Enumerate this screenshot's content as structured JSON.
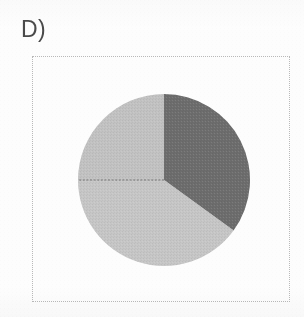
{
  "figure": {
    "panel_label": "D)",
    "frame": {
      "style": "dotted",
      "color": "#b9b9b9"
    }
  },
  "chart_data": {
    "type": "pie",
    "title": "D)",
    "subtitle": "",
    "xlabel": "",
    "ylabel": "",
    "grid": false,
    "legend": "none",
    "labels_shown": false,
    "start_angle_deg": 0,
    "direction": "clockwise",
    "center": {
      "cx": 87,
      "cy": 87,
      "r": 86
    },
    "categories": [
      "Segment 1",
      "Segment 2",
      "Segment 3"
    ],
    "values": [
      35,
      40,
      25
    ],
    "units": "percent",
    "slices": [
      {
        "name": "Segment 1",
        "value": 35,
        "color": "#6d6d6d",
        "start_angle_deg": 0,
        "end_angle_deg": 126,
        "position": "right"
      },
      {
        "name": "Segment 2",
        "value": 40,
        "color": "#c6c6c6",
        "start_angle_deg": 126,
        "end_angle_deg": 270,
        "position": "lower-left"
      },
      {
        "name": "Segment 3",
        "value": 25,
        "color": "#c2c2c2",
        "start_angle_deg": 270,
        "end_angle_deg": 360,
        "position": "upper-left"
      }
    ],
    "separator_lines": [
      {
        "from": "center",
        "to_angle_deg": 0,
        "style": "solid",
        "color": "#9a9a9a"
      },
      {
        "from": "center",
        "to_angle_deg": 126,
        "style": "solid",
        "color": "#9a9a9a"
      },
      {
        "from": "center",
        "to_angle_deg": 270,
        "style": "dashed",
        "color": "#6a6a6a"
      }
    ],
    "colors": {
      "dark_gray": "#6d6d6d",
      "light_gray": "#c6c6c6",
      "light_gray_alt": "#c2c2c2",
      "background": "#fdfdfd",
      "frame": "#b9b9b9",
      "label": "#4a4a4a"
    }
  }
}
